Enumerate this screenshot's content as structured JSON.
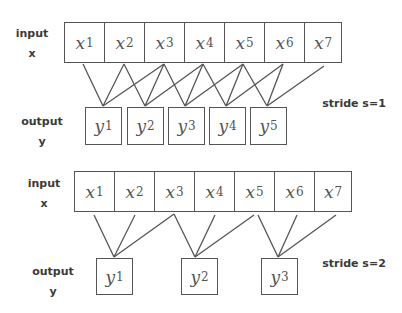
{
  "diagrams": [
    {
      "id": "stride1",
      "input_label": "input",
      "input_var": "x",
      "output_label": "output",
      "output_var": "y",
      "stride_label": "stride s=1",
      "inputs": [
        {
          "base": "x",
          "sub": "1"
        },
        {
          "base": "x",
          "sub": "2"
        },
        {
          "base": "x",
          "sub": "3"
        },
        {
          "base": "x",
          "sub": "4"
        },
        {
          "base": "x",
          "sub": "5"
        },
        {
          "base": "x",
          "sub": "6"
        },
        {
          "base": "x",
          "sub": "7"
        }
      ],
      "outputs": [
        {
          "base": "y",
          "sub": "1"
        },
        {
          "base": "y",
          "sub": "2"
        },
        {
          "base": "y",
          "sub": "3"
        },
        {
          "base": "y",
          "sub": "4"
        },
        {
          "base": "y",
          "sub": "5"
        }
      ],
      "connections": [
        [
          1,
          2,
          3
        ],
        [
          2,
          3,
          4
        ],
        [
          3,
          4,
          5
        ],
        [
          4,
          5,
          6
        ],
        [
          5,
          6,
          7
        ]
      ]
    },
    {
      "id": "stride2",
      "input_label": "input",
      "input_var": "x",
      "output_label": "output",
      "output_var": "y",
      "stride_label": "stride s=2",
      "inputs": [
        {
          "base": "x",
          "sub": "1"
        },
        {
          "base": "x",
          "sub": "2"
        },
        {
          "base": "x",
          "sub": "3"
        },
        {
          "base": "x",
          "sub": "4"
        },
        {
          "base": "x",
          "sub": "5"
        },
        {
          "base": "x",
          "sub": "6"
        },
        {
          "base": "x",
          "sub": "7"
        }
      ],
      "outputs": [
        {
          "base": "y",
          "sub": "1"
        },
        {
          "base": "y",
          "sub": "2"
        },
        {
          "base": "y",
          "sub": "3"
        }
      ],
      "connections": [
        [
          1,
          2,
          3
        ],
        [
          3,
          4,
          5
        ],
        [
          5,
          6,
          7
        ]
      ]
    }
  ],
  "colors": {
    "stroke": "#555555",
    "label": "#3a3a3a"
  }
}
